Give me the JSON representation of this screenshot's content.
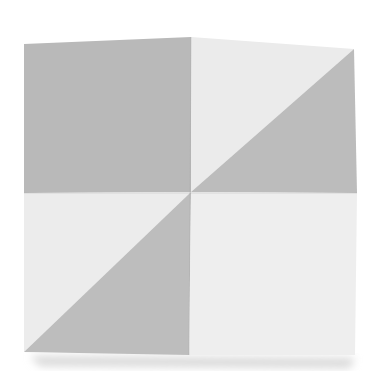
{
  "image": {
    "subject": "folded square paper with crease pattern (two quadrants dark, two light, split diagonally)",
    "colors": {
      "background": "#ffffff",
      "dark_gray": "#b9b9b9",
      "light_gray": "#ebebeb",
      "shadow": "#dcdcdc"
    }
  }
}
